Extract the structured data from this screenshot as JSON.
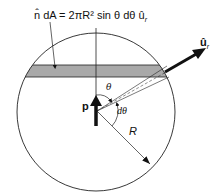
{
  "figure": {
    "equation": "n̂ dA = 2πR² sin θ dθ û",
    "equation_sub": "r",
    "unit_vector_label": "û",
    "unit_vector_sub": "r",
    "dipole_label": "p",
    "theta_label": "θ",
    "dtheta_label": "dθ",
    "radius_label": "R"
  },
  "colors": {
    "band": "#a9a9a9",
    "line": "#222222"
  }
}
